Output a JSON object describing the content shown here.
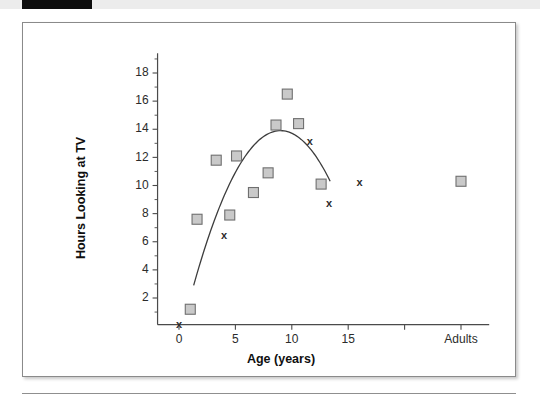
{
  "page": {
    "header_strip_color": "#0d0d0d",
    "strip_background_color": "#ececec"
  },
  "chart_data": {
    "type": "scatter",
    "title": "",
    "xlabel": "Age (years)",
    "ylabel": "Hours Looking at TV",
    "xlim": [
      -1.5,
      22
    ],
    "ylim": [
      0,
      19.6
    ],
    "grid": false,
    "legend": null,
    "x_tick_labels": [
      "0",
      "5",
      "10",
      "15",
      "",
      "Adults"
    ],
    "x_tick_values": [
      0,
      5,
      10,
      15,
      20,
      25
    ],
    "y_tick_labels": [
      "2",
      "4",
      "6",
      "8",
      "10",
      "12",
      "14",
      "16",
      "18"
    ],
    "y_tick_values": [
      2,
      4,
      6,
      8,
      10,
      12,
      14,
      16,
      18
    ],
    "series": [
      {
        "name": "squares",
        "marker": "square",
        "marker_fill": "#c9c9c9",
        "marker_edge": "#6f6f6f",
        "points": [
          {
            "x": 1.0,
            "y": 1.2
          },
          {
            "x": 1.6,
            "y": 7.6
          },
          {
            "x": 3.3,
            "y": 11.8
          },
          {
            "x": 4.5,
            "y": 7.9
          },
          {
            "x": 5.1,
            "y": 12.1
          },
          {
            "x": 6.6,
            "y": 9.5
          },
          {
            "x": 7.9,
            "y": 10.9
          },
          {
            "x": 8.6,
            "y": 14.3
          },
          {
            "x": 9.6,
            "y": 16.5
          },
          {
            "x": 10.6,
            "y": 14.4
          },
          {
            "x": 12.6,
            "y": 10.1
          },
          {
            "x": 25.0,
            "y": 10.3
          }
        ]
      },
      {
        "name": "x-marks",
        "marker": "x",
        "marker_color": "#2b2b2b",
        "points": [
          {
            "x": 0.0,
            "y": 0.05
          },
          {
            "x": 4.0,
            "y": 6.4
          },
          {
            "x": 11.6,
            "y": 13.1
          },
          {
            "x": 13.3,
            "y": 8.7
          },
          {
            "x": 16.0,
            "y": 10.2
          }
        ]
      }
    ],
    "fit_curve": {
      "name": "quadratic-fit",
      "color": "#3d3d3d",
      "x_start": 1.3,
      "x_end": 13.4,
      "vertex_x": 9.0,
      "vertex_y": 13.9,
      "y_start": 2.9,
      "y_end": 6.0
    }
  }
}
